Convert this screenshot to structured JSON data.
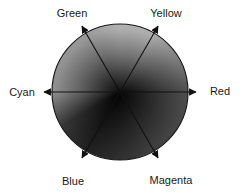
{
  "figure": {
    "type": "color-wheel-diagram",
    "labels": {
      "green": "Green",
      "yellow": "Yellow",
      "cyan": "Cyan",
      "red": "Red",
      "blue": "Blue",
      "magenta": "Magenta"
    },
    "axes": [
      {
        "label": "Red",
        "angle_deg": 0
      },
      {
        "label": "Yellow",
        "angle_deg": 60
      },
      {
        "label": "Green",
        "angle_deg": 120
      },
      {
        "label": "Cyan",
        "angle_deg": 180
      },
      {
        "label": "Blue",
        "angle_deg": 240
      },
      {
        "label": "Magenta",
        "angle_deg": 300
      }
    ],
    "wheel": {
      "outline_color": "#1a1a1a",
      "arrow_color": "#111111",
      "center_shade": "#111111",
      "rim_shades": {
        "top": "#cdcdcd",
        "yellow": "#c6c6c6",
        "red": "#585858",
        "magenta": "#484848",
        "blue": "#242424",
        "blue_cyan": "#3e3e3e",
        "cyan": "#a2a2a2",
        "green": "#b2b2b2"
      }
    }
  }
}
